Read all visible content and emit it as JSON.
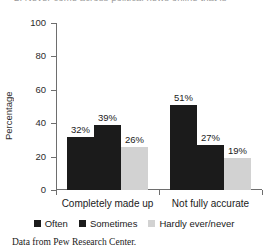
{
  "cutoff_text": "2. Never come across political news online that is",
  "caption": "Data from Pew Research Center.",
  "legend": {
    "position": "bottom-center",
    "items": [
      {
        "label": "Often",
        "color": "#1b1b1b"
      },
      {
        "label": "Sometimes",
        "color": "#1b1b1b"
      },
      {
        "label": "Hardly ever/never",
        "color": "#d2d2d2"
      }
    ]
  },
  "chart_data": {
    "type": "bar",
    "title": "",
    "subtitle": "",
    "xlabel": "",
    "ylabel": "Percentage",
    "ylim": [
      0,
      100
    ],
    "yticks": [
      0,
      20,
      40,
      60,
      80,
      100
    ],
    "ytick_labels": [
      "0",
      "20",
      "40",
      "60",
      "80",
      "100"
    ],
    "grid": false,
    "legend_position": "bottom-center",
    "categories": [
      "Completely made up",
      "Not fully accurate"
    ],
    "series": [
      {
        "name": "Often",
        "color": "#1b1b1b",
        "values": [
          32,
          39
        ],
        "labels": [
          "32%",
          "39%"
        ]
      },
      {
        "name": "Sometimes",
        "color": "#1b1b1b",
        "values": [
          39,
          27
        ],
        "labels": [
          "39%",
          "27%"
        ]
      },
      {
        "name": "Hardly ever/never",
        "color": "#d2d2d2",
        "values": [
          26,
          19
        ],
        "labels": [
          "26%",
          "19%"
        ]
      }
    ],
    "groups": [
      {
        "category": "Completely made up",
        "bars": [
          {
            "series": "Often",
            "value": 32,
            "label": "32%",
            "color": "#1b1b1b"
          },
          {
            "series": "Sometimes",
            "value": 39,
            "label": "39%",
            "color": "#1b1b1b"
          },
          {
            "series": "Hardly ever/never",
            "value": 26,
            "label": "26%",
            "color": "#d2d2d2"
          }
        ]
      },
      {
        "category": "Not fully accurate",
        "bars": [
          {
            "series": "Often",
            "value": 51,
            "label": "51%",
            "color": "#1b1b1b"
          },
          {
            "series": "Sometimes",
            "value": 27,
            "label": "27%",
            "color": "#1b1b1b"
          },
          {
            "series": "Hardly ever/never",
            "value": 19,
            "label": "19%",
            "color": "#d2d2d2"
          }
        ]
      }
    ]
  }
}
